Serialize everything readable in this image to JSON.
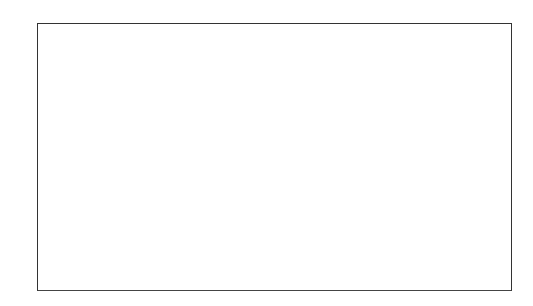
{
  "chart_data": {
    "type": "bar",
    "xlabel": "",
    "ylabel": "",
    "ylim": [
      0,
      40
    ],
    "yticks": [
      0,
      5,
      10,
      15,
      20,
      25,
      30,
      35,
      40
    ],
    "grid": false,
    "legend": null,
    "categories": [
      "Citrus- Green",
      "Floral -Aldeydic",
      "Fruity",
      "Floriental",
      "Amber-Oriental",
      "Chypre"
    ],
    "values": [
      7,
      15,
      33,
      27,
      16,
      2.2
    ]
  },
  "bars": [
    {
      "label": "Citrus- Green",
      "gradient": [
        "#7a7a7a",
        "#c4c4c4"
      ]
    },
    {
      "label": "Floral -Aldeydic",
      "gradient": [
        "#4a4a4a",
        "#ffffff"
      ]
    },
    {
      "label": "Fruity",
      "gradient": [
        "#c8c8c8",
        "#a8a8a8"
      ]
    },
    {
      "label": "Floriental",
      "gradient": [
        "#9a9a9a",
        "#b4b4b4"
      ]
    },
    {
      "label": "Amber-Oriental",
      "gradient": [
        "#1e1e1e",
        "#8a8a8a"
      ]
    },
    {
      "label": "Chypre",
      "gradient": [
        "#1a1a1a",
        "#2a2a2a"
      ]
    }
  ]
}
